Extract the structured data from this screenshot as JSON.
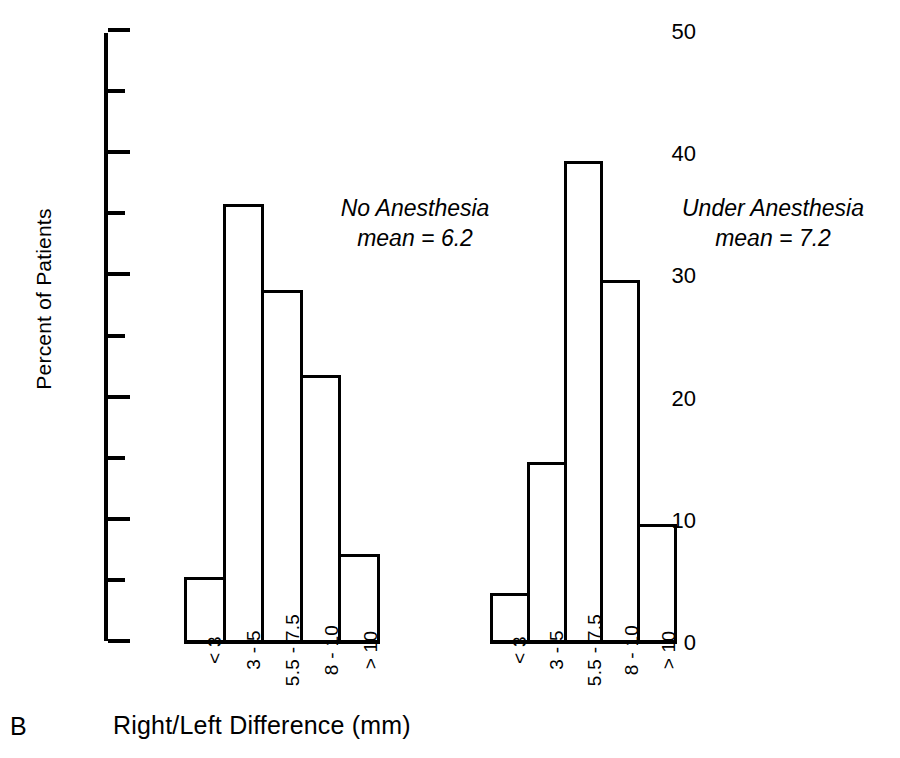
{
  "panel": {
    "letter": "B"
  },
  "chart_data": {
    "type": "bar",
    "title": "",
    "subtitle": "",
    "xlabel": "Right/Left Difference (mm)",
    "ylabel": "Percent of Patients",
    "ylim": [
      0,
      50
    ],
    "grid": false,
    "legend": "none",
    "categories": [
      "< 3",
      "3 - 5",
      "5.5 - 7.5",
      "8 - 10",
      "> 10"
    ],
    "y_major_ticks": [
      0,
      10,
      20,
      30,
      40,
      50
    ],
    "y_major_tick_labels": [
      "0",
      "10",
      "20",
      "30",
      "40",
      "50"
    ],
    "y_minor_ticks": [
      5,
      15,
      25,
      35,
      45
    ],
    "panels": [
      {
        "name": "No Anesthesia",
        "annotation_line1": "No Anesthesia",
        "annotation_line2": "mean = 6.2",
        "mean": 6.2,
        "values": [
          5.5,
          36.0,
          29.0,
          22.0,
          7.4
        ]
      },
      {
        "name": "Under Anesthesia",
        "annotation_line1": "Under Anesthesia",
        "annotation_line2": "mean = 7.2",
        "mean": 7.2,
        "values": [
          4.2,
          14.9,
          39.5,
          29.8,
          9.8
        ]
      }
    ],
    "bar_style": {
      "fill": "#ffffff",
      "edge": "#000000",
      "edge_width": 3
    }
  }
}
